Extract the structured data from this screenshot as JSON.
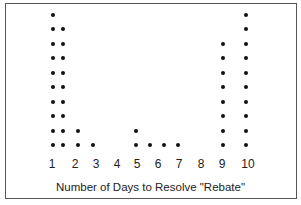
{
  "chart_data": {
    "type": "scatter",
    "subtype": "dot-plot",
    "title": "",
    "xlabel": "Number of Days to Resolve \"Rebate\"",
    "ylabel": "",
    "tick_labels": [
      "1",
      "2",
      "3",
      "4",
      "5",
      "6",
      "7",
      "8",
      "9",
      "10"
    ],
    "tick_x_px": [
      52,
      75,
      96,
      117,
      137,
      158,
      179,
      201,
      222,
      248
    ],
    "columns": [
      {
        "x_px": 53,
        "approx_value": 1,
        "count": 10
      },
      {
        "x_px": 63,
        "approx_value": 1.5,
        "count": 9
      },
      {
        "x_px": 78,
        "approx_value": 2,
        "count": 2
      },
      {
        "x_px": 93,
        "approx_value": 3,
        "count": 1
      },
      {
        "x_px": 136,
        "approx_value": 5,
        "count": 2
      },
      {
        "x_px": 150,
        "approx_value": 5.7,
        "count": 1
      },
      {
        "x_px": 164,
        "approx_value": 6.3,
        "count": 1
      },
      {
        "x_px": 178,
        "approx_value": 7,
        "count": 1
      },
      {
        "x_px": 223,
        "approx_value": 9,
        "count": 8
      },
      {
        "x_px": 246,
        "approx_value": 10,
        "count": 10
      }
    ],
    "dot_row_base_y_px": 145,
    "dot_row_spacing_px": 14.5,
    "grid": false,
    "legend": null
  }
}
